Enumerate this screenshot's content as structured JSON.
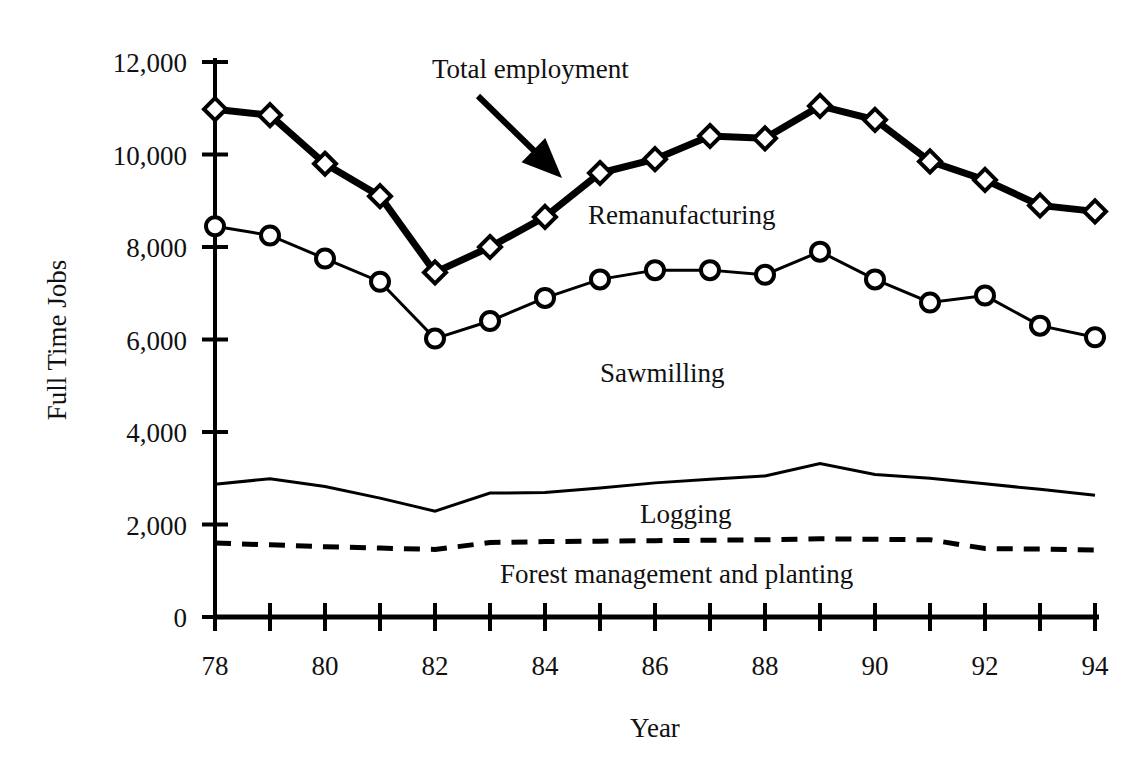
{
  "chart_data": {
    "type": "line",
    "title": "",
    "xlabel": "Year",
    "ylabel": "Full Time Jobs",
    "xlim": [
      78,
      94
    ],
    "ylim": [
      0,
      12000
    ],
    "grid": false,
    "legend_position": "inline-annotations",
    "x": [
      78,
      79,
      80,
      81,
      82,
      83,
      84,
      85,
      86,
      87,
      88,
      89,
      90,
      91,
      92,
      93,
      94
    ],
    "x_tick_labels": [
      "78",
      "",
      "80",
      "",
      "82",
      "",
      "84",
      "",
      "86",
      "",
      "88",
      "",
      "90",
      "",
      "92",
      "",
      "94"
    ],
    "y_ticks": [
      0,
      2000,
      4000,
      6000,
      8000,
      10000,
      12000
    ],
    "y_tick_labels": [
      "0",
      "2,000",
      "4,000",
      "6,000",
      "8,000",
      "10,000",
      "12,000"
    ],
    "series": [
      {
        "name": "Total employment",
        "marker": "diamond",
        "line_style": "solid",
        "line_width": 7,
        "values": [
          10980,
          10850,
          9800,
          9100,
          7450,
          8000,
          8650,
          9600,
          9900,
          10400,
          10350,
          11050,
          10750,
          9850,
          9450,
          8900,
          8770
        ]
      },
      {
        "name": "Sawmilling",
        "marker": "circle",
        "line_style": "solid",
        "line_width": 3,
        "values": [
          8450,
          8250,
          7750,
          7250,
          6020,
          6400,
          6900,
          7300,
          7500,
          7500,
          7400,
          7900,
          7300,
          6800,
          6950,
          6300,
          6050
        ]
      },
      {
        "name": "Logging",
        "marker": "none",
        "line_style": "solid",
        "line_width": 3,
        "values": [
          2870,
          2990,
          2820,
          2570,
          2290,
          2680,
          2690,
          2790,
          2900,
          2980,
          3050,
          3320,
          3080,
          3000,
          2880,
          2760,
          2630
        ]
      },
      {
        "name": "Forest management and planting",
        "marker": "none",
        "line_style": "dashed",
        "line_width": 5,
        "values": [
          1600,
          1560,
          1520,
          1490,
          1460,
          1610,
          1630,
          1640,
          1650,
          1660,
          1670,
          1690,
          1680,
          1670,
          1480,
          1470,
          1450
        ]
      }
    ],
    "annotations": [
      {
        "text": "Total employment",
        "x_px": 432,
        "y_px": 78,
        "has_arrow": true,
        "arrow_from": [
          478,
          96
        ],
        "arrow_to": [
          562,
          178
        ]
      },
      {
        "text": "Remanufacturing",
        "x_px": 588,
        "y_px": 224,
        "has_arrow": false
      },
      {
        "text": "Sawmilling",
        "x_px": 600,
        "y_px": 382,
        "has_arrow": false
      },
      {
        "text": "Logging",
        "x_px": 640,
        "y_px": 523,
        "has_arrow": false
      },
      {
        "text": "Forest management and planting",
        "x_px": 500,
        "y_px": 583,
        "has_arrow": false
      }
    ],
    "colors": {
      "line": "#000000",
      "marker_fill": "#ffffff",
      "background": "#ffffff",
      "text": "#111111"
    }
  }
}
